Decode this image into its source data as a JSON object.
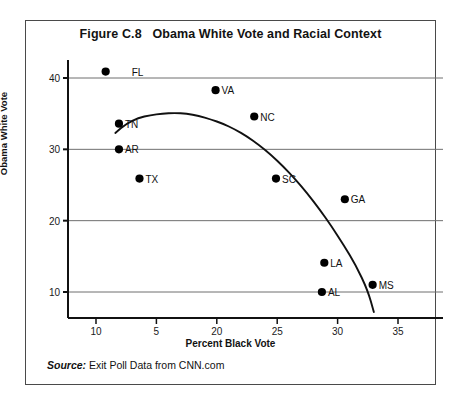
{
  "figure": {
    "title": "Figure C.8   Obama White Vote and Racial Context",
    "source_word": "Source:",
    "source_text": " Exit Poll Data from CNN.com"
  },
  "chart_data": {
    "type": "scatter",
    "title": "Figure C.8   Obama White Vote and Racial Context",
    "xlabel": "Percent Black Vote",
    "ylabel": "Obama White Vote",
    "xlim": [
      8.5,
      36.5
    ],
    "ylim": [
      6.5,
      42.5
    ],
    "grid": "horizontal",
    "legend": "none",
    "x_ticks": [
      {
        "value": 10,
        "label": "10"
      },
      {
        "value": 15,
        "label": "5"
      },
      {
        "value": 20,
        "label": "20"
      },
      {
        "value": 25,
        "label": "25"
      },
      {
        "value": 30,
        "label": "30"
      },
      {
        "value": 35,
        "label": "35"
      }
    ],
    "y_ticks": [
      {
        "value": 40,
        "label": "40"
      },
      {
        "value": 30,
        "label": "30"
      },
      {
        "value": 20,
        "label": "20"
      },
      {
        "value": 10,
        "label": "10"
      }
    ],
    "points": [
      {
        "label": "FL",
        "x": 10.8,
        "y": 40.9,
        "label_dx": 26,
        "label_dy": 0
      },
      {
        "label": "VA",
        "x": 19.9,
        "y": 38.3,
        "label_dx": 6,
        "label_dy": 0
      },
      {
        "label": "NC",
        "x": 23.1,
        "y": 34.6,
        "label_dx": 6,
        "label_dy": 0
      },
      {
        "label": "TN",
        "x": 11.9,
        "y": 33.6,
        "label_dx": 6,
        "label_dy": 0
      },
      {
        "label": "AR",
        "x": 11.9,
        "y": 30.0,
        "label_dx": 6,
        "label_dy": 0
      },
      {
        "label": "TX",
        "x": 13.6,
        "y": 25.9,
        "label_dx": 6,
        "label_dy": 0
      },
      {
        "label": "SC",
        "x": 24.9,
        "y": 25.9,
        "label_dx": 6,
        "label_dy": 0
      },
      {
        "label": "GA",
        "x": 30.6,
        "y": 23.0,
        "label_dx": 6,
        "label_dy": 0
      },
      {
        "label": "LA",
        "x": 28.9,
        "y": 14.1,
        "label_dx": 6,
        "label_dy": 0
      },
      {
        "label": "MS",
        "x": 32.9,
        "y": 11.0,
        "label_dx": 6,
        "label_dy": 0
      },
      {
        "label": "AL",
        "x": 28.7,
        "y": 10.0,
        "label_dx": 6,
        "label_dy": 0
      }
    ],
    "trend_curve": {
      "name": "fitted quadratic trend",
      "points": [
        {
          "x": 11.6,
          "y": 32.3
        },
        {
          "x": 12.5,
          "y": 33.6
        },
        {
          "x": 13.5,
          "y": 34.4
        },
        {
          "x": 14.5,
          "y": 34.8
        },
        {
          "x": 15.5,
          "y": 35.0
        },
        {
          "x": 16.5,
          "y": 35.1
        },
        {
          "x": 17.5,
          "y": 35.0
        },
        {
          "x": 18.5,
          "y": 34.7
        },
        {
          "x": 19.5,
          "y": 34.2
        },
        {
          "x": 20.5,
          "y": 33.6
        },
        {
          "x": 21.5,
          "y": 32.8
        },
        {
          "x": 22.5,
          "y": 31.8
        },
        {
          "x": 23.5,
          "y": 30.6
        },
        {
          "x": 24.5,
          "y": 29.2
        },
        {
          "x": 25.5,
          "y": 27.6
        },
        {
          "x": 26.5,
          "y": 25.8
        },
        {
          "x": 27.5,
          "y": 23.8
        },
        {
          "x": 28.5,
          "y": 21.6
        },
        {
          "x": 29.5,
          "y": 19.2
        },
        {
          "x": 30.5,
          "y": 16.6
        },
        {
          "x": 31.5,
          "y": 13.8
        },
        {
          "x": 32.5,
          "y": 10.2
        },
        {
          "x": 33.0,
          "y": 7.2
        }
      ]
    }
  },
  "style": {
    "axis_color": "#111111",
    "grid_color": "#6f6f6f",
    "point_color": "#000000",
    "curve_color": "#111111",
    "frame_color": "#4a4a4a"
  }
}
